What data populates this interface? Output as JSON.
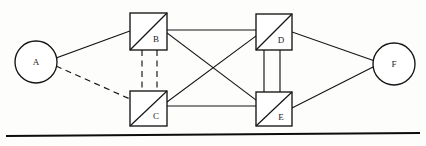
{
  "diagram": {
    "background_color": "#fdfdfc",
    "line_color": "#141414",
    "nodes": [
      {
        "id": "A",
        "label": "A",
        "shape": "circle",
        "cx": 36,
        "cy": 62,
        "r": 21,
        "label_x": 36,
        "label_y": 63
      },
      {
        "id": "B",
        "label": "B",
        "shape": "square-split",
        "x": 130,
        "y": 13,
        "w": 37,
        "h": 37,
        "diagonal": "bottom-left-to-top-right",
        "label_x": 156,
        "label_y": 40
      },
      {
        "id": "C",
        "label": "C",
        "shape": "square-split",
        "x": 130,
        "y": 91,
        "w": 37,
        "h": 35,
        "diagonal": "bottom-left-to-top-right",
        "label_x": 156,
        "label_y": 117
      },
      {
        "id": "D",
        "label": "D",
        "shape": "square-split",
        "x": 256,
        "y": 14,
        "w": 36,
        "h": 36,
        "diagonal": "bottom-left-to-top-right",
        "label_x": 281,
        "label_y": 41
      },
      {
        "id": "E",
        "label": "E",
        "shape": "square-split",
        "x": 256,
        "y": 92,
        "w": 36,
        "h": 34,
        "diagonal": "bottom-left-to-top-right",
        "label_x": 281,
        "label_y": 118
      },
      {
        "id": "F",
        "label": "F",
        "shape": "circle",
        "cx": 394,
        "cy": 64,
        "r": 21,
        "label_x": 394,
        "label_y": 65
      }
    ],
    "edges": [
      {
        "id": "A-B",
        "from": "A",
        "to": "B",
        "style": "solid",
        "x1": 56,
        "y1": 58,
        "x2": 130,
        "y2": 31
      },
      {
        "id": "A-C",
        "from": "A",
        "to": "C",
        "style": "dashed",
        "x1": 56,
        "y1": 66,
        "x2": 130,
        "y2": 99
      },
      {
        "id": "B-D",
        "from": "B",
        "to": "D",
        "style": "solid",
        "x1": 167,
        "y1": 30,
        "x2": 256,
        "y2": 30
      },
      {
        "id": "B-E",
        "from": "B",
        "to": "E",
        "style": "solid",
        "x1": 167,
        "y1": 33,
        "x2": 256,
        "y2": 100
      },
      {
        "id": "C-D",
        "from": "C",
        "to": "D",
        "style": "solid",
        "x1": 167,
        "y1": 102,
        "x2": 256,
        "y2": 36
      },
      {
        "id": "C-E",
        "from": "C",
        "to": "E",
        "style": "solid",
        "x1": 167,
        "y1": 106,
        "x2": 256,
        "y2": 106
      },
      {
        "id": "B-C-left",
        "from": "B",
        "to": "C",
        "style": "dashed",
        "x1": 142,
        "y1": 50,
        "x2": 142,
        "y2": 91
      },
      {
        "id": "B-C-right",
        "from": "B",
        "to": "C",
        "style": "dashed",
        "x1": 157,
        "y1": 50,
        "x2": 157,
        "y2": 91
      },
      {
        "id": "D-E-left",
        "from": "D",
        "to": "E",
        "style": "solid",
        "x1": 264,
        "y1": 50,
        "x2": 264,
        "y2": 92
      },
      {
        "id": "D-E-right",
        "from": "D",
        "to": "E",
        "style": "solid",
        "x1": 280,
        "y1": 50,
        "x2": 280,
        "y2": 92
      },
      {
        "id": "D-F",
        "from": "D",
        "to": "F",
        "style": "solid",
        "x1": 292,
        "y1": 32,
        "x2": 375,
        "y2": 61
      },
      {
        "id": "E-F",
        "from": "E",
        "to": "F",
        "style": "solid",
        "x1": 292,
        "y1": 108,
        "x2": 375,
        "y2": 66
      }
    ],
    "baseline_rule": {
      "id": "bottom-rule",
      "x1": 6,
      "y1": 136,
      "x2": 420,
      "y2": 133
    }
  }
}
